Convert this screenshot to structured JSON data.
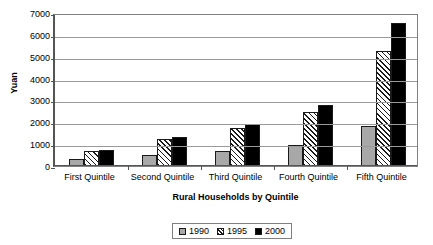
{
  "chart_data": {
    "type": "bar",
    "title": "",
    "xlabel": "Rural Households by Quintile",
    "ylabel": "Yuan",
    "categories": [
      "First Quintile",
      "Second Quintile",
      "Third Quintile",
      "Fourth Quintile",
      "Fifth Quintile"
    ],
    "series": [
      {
        "name": "1990",
        "values": [
          300,
          520,
          700,
          980,
          1850
        ],
        "color": "#a8a8a8",
        "fill": "solid-gray"
      },
      {
        "name": "1995",
        "values": [
          700,
          1250,
          1750,
          2480,
          5250
        ],
        "color": "#ffffff",
        "fill": "diagonal-hatch"
      },
      {
        "name": "2000",
        "values": [
          720,
          1350,
          1900,
          2800,
          6550
        ],
        "color": "#000000",
        "fill": "solid-black"
      }
    ],
    "ylim": [
      0,
      7000
    ],
    "yticks": [
      0,
      1000,
      2000,
      3000,
      4000,
      5000,
      6000,
      7000
    ],
    "ytick_labels": [
      "0",
      "1000",
      "2000",
      "3000",
      "4000",
      "5000",
      "6000",
      "7000"
    ],
    "grid": true,
    "grid_axis": "y",
    "legend_position": "bottom-center",
    "legend_entries": [
      "1990",
      "1995",
      "2000"
    ]
  }
}
